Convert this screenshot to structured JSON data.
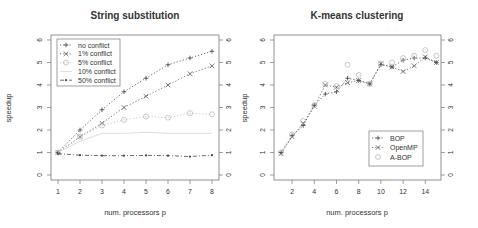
{
  "chart_data": [
    {
      "type": "line",
      "title": "String substitution",
      "xlabel": "num. processors p",
      "ylabel": "speedup",
      "x": [
        1,
        2,
        3,
        4,
        5,
        6,
        7,
        8
      ],
      "xticks": [
        1,
        2,
        3,
        4,
        5,
        6,
        7,
        8
      ],
      "yticks": [
        0,
        1,
        2,
        3,
        4,
        5,
        6
      ],
      "xlim": [
        0.75,
        8.25
      ],
      "ylim": [
        -0.2,
        6.2
      ],
      "grid": false,
      "legend_position": "topleft",
      "series": [
        {
          "name": "no conflict",
          "marker": "+",
          "line": "dotted",
          "color": "#444444",
          "values": [
            1.0,
            2.0,
            2.9,
            3.7,
            4.3,
            4.9,
            5.2,
            5.5
          ]
        },
        {
          "name": "1% conflict",
          "marker": "x",
          "line": "dotted",
          "color": "#555555",
          "values": [
            1.0,
            1.7,
            2.3,
            3.0,
            3.5,
            4.0,
            4.5,
            4.85
          ]
        },
        {
          "name": "5% conflict",
          "marker": "o",
          "line": "dotted",
          "color": "#bbbbbb",
          "values": [
            1.0,
            1.7,
            2.2,
            2.45,
            2.6,
            2.55,
            2.75,
            2.7
          ]
        },
        {
          "name": "10% conflict",
          "marker": "none",
          "line": "solid",
          "color": "#dddddd",
          "values": [
            1.0,
            1.5,
            1.85,
            1.85,
            1.9,
            1.85,
            1.85,
            1.85
          ]
        },
        {
          "name": "50% conflict",
          "marker": "*",
          "line": "dashdot",
          "color": "#444444",
          "values": [
            0.95,
            0.88,
            0.86,
            0.86,
            0.87,
            0.86,
            0.82,
            0.88
          ]
        }
      ]
    },
    {
      "type": "line",
      "title": "K-means clustering",
      "xlabel": "num. processors p",
      "ylabel": "speedup",
      "x": [
        1,
        2,
        3,
        4,
        5,
        6,
        7,
        8,
        9,
        10,
        11,
        12,
        13,
        14,
        15
      ],
      "xticks": [
        2,
        4,
        6,
        8,
        10,
        12,
        14
      ],
      "yticks": [
        0,
        1,
        2,
        3,
        4,
        5,
        6
      ],
      "xlim": [
        0.4,
        15.6
      ],
      "ylim": [
        -0.2,
        6.2
      ],
      "grid": false,
      "legend_position": "bottomright",
      "series": [
        {
          "name": "BOP",
          "marker": "+",
          "line": "dotted",
          "color": "#444444",
          "values": [
            1.0,
            1.75,
            2.2,
            3.1,
            3.6,
            3.7,
            4.3,
            4.2,
            4.05,
            4.9,
            4.8,
            5.1,
            5.2,
            5.2,
            5.0
          ]
        },
        {
          "name": "OpenMP",
          "marker": "x",
          "line": "dotted",
          "color": "#555555",
          "values": [
            0.95,
            1.7,
            2.3,
            3.05,
            4.0,
            3.9,
            4.1,
            4.2,
            4.05,
            4.95,
            4.8,
            4.6,
            4.85,
            5.25,
            5.0
          ]
        },
        {
          "name": "A-BOP",
          "marker": "o",
          "line": "none",
          "color": "#bbbbbb",
          "values": [
            1.0,
            1.8,
            2.4,
            3.1,
            4.05,
            3.95,
            4.9,
            4.45,
            4.05,
            4.95,
            5.0,
            5.2,
            5.3,
            5.55,
            5.3
          ]
        }
      ]
    }
  ],
  "charts": {
    "left": {
      "title": "String substitution",
      "xlabel": "num. processors p",
      "ylabel": "speedup",
      "legend": [
        "no conflict",
        "1% conflict",
        "5% conflict",
        "10% conflict",
        "50% conflict"
      ]
    },
    "right": {
      "title": "K-means clustering",
      "xlabel": "num. processors p",
      "ylabel": "speedup",
      "legend": [
        "BOP",
        "OpenMP",
        "A-BOP"
      ]
    }
  }
}
